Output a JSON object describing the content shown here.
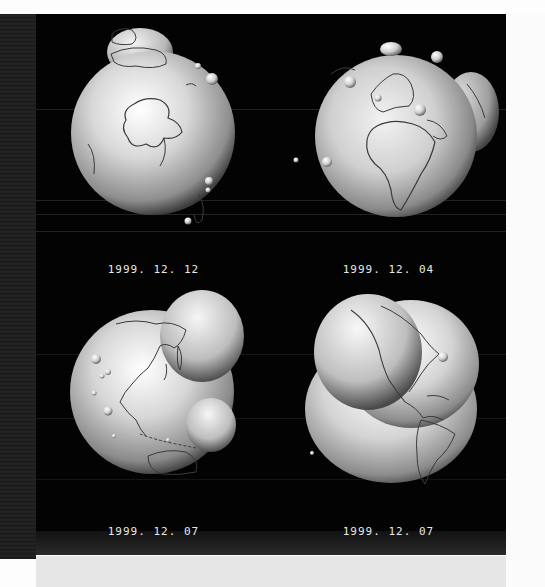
{
  "figure": {
    "background_color": "#030303",
    "globe_color": "#cfcfcf",
    "coastline_color": "#3a3a3a",
    "caption_color": "#e8e8e8"
  },
  "panels": [
    {
      "position": "top-left",
      "view": "south-polar view centered on Antarctica, Australia at top rim",
      "caption": "1999. 12. 12"
    },
    {
      "position": "top-right",
      "view": "Africa and Europe facing viewer, bulge on right limb",
      "caption": "1999. 12. 04"
    },
    {
      "position": "bottom-left",
      "view": "East Asia, Japan, Indonesia and Australia; large bulge upper right, smaller lobe lower right",
      "caption": "1999. 12. 07"
    },
    {
      "position": "bottom-right",
      "view": "North and South America; large lobe on upper-left",
      "caption": "1999. 12. 07"
    }
  ]
}
